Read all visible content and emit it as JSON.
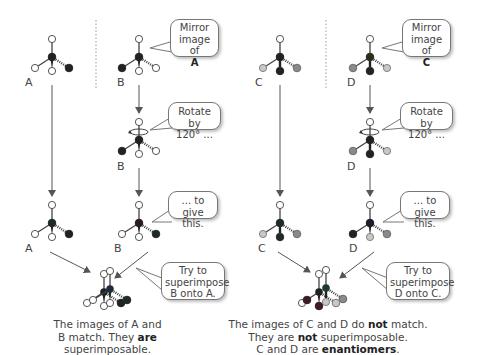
{
  "colors": {
    "white_atom": "#ffffff",
    "black_atom": "#222222",
    "dark_center": "#1f2a26",
    "light_grey_atom": "#c8c8c8",
    "mid_grey_atom": "#8a8a8a",
    "bond": "#444444",
    "arrow": "#555555",
    "divider": "#aaaaaa"
  },
  "labels": {
    "A_top": "A",
    "B_top": "B",
    "B_mid": "B",
    "A_bottom": "A",
    "B_bottom": "B",
    "C_top": "C",
    "D_top": "D",
    "D_mid": "D",
    "C_bottom": "C",
    "D_bottom": "D"
  },
  "bubbles": {
    "mirror_A": {
      "line1": "Mirror",
      "line2": "image of",
      "bold": "A"
    },
    "rotate_B": {
      "line1": "Rotate by",
      "line2": "120° ..."
    },
    "give_B": {
      "line1": "... to give",
      "line2": "this."
    },
    "superimpose_B": {
      "line1": "Try to",
      "line2": "superimpose",
      "line3": "B onto A."
    },
    "mirror_C": {
      "line1": "Mirror",
      "line2": "image of",
      "bold": "C"
    },
    "rotate_D": {
      "line1": "Rotate by",
      "line2": "120° ..."
    },
    "give_D": {
      "line1": "... to give",
      "line2": "this."
    },
    "superimpose_D": {
      "line1": "Try to",
      "line2": "superimpose",
      "line3": "D onto C."
    }
  },
  "captions": {
    "left": {
      "line1": "The images of A and",
      "line2_pre": "B match. They ",
      "line2_bold": "are",
      "line3": "superimposable."
    },
    "right": {
      "line1_pre": "The images of C and D do ",
      "line1_bold": "not",
      "line1_post": " match.",
      "line2_pre": "They are ",
      "line2_bold": "not",
      "line2_post": " superimposable.",
      "line3_pre": "C and D are ",
      "line3_bold": "enantiomers",
      "line3_post": "."
    }
  }
}
